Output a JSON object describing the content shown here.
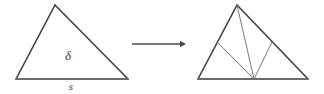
{
  "figure": {
    "background_color": "#ffffff",
    "stroke_color_outer": "#3f3f3f",
    "stroke_color_inner": "#7b7b7b",
    "stroke_color_base": "#6b6b6b",
    "arrow_color": "#4a4a4a",
    "stroke_width_outer": 1.6,
    "stroke_width_inner": 1.0
  },
  "left_triangle": {
    "name": "source-triangle",
    "vertices": {
      "apex": {
        "x": 55,
        "y": 5
      },
      "bottom_left": {
        "x": 16,
        "y": 79
      },
      "bottom_right": {
        "x": 128,
        "y": 79
      }
    },
    "labels": {
      "interior": {
        "text": "δ",
        "x": 68,
        "y": 60
      },
      "base": {
        "text": "s",
        "x": 71,
        "y": 90
      }
    }
  },
  "arrow": {
    "name": "transformation-arrow",
    "x1": 132,
    "y1": 44,
    "x2": 186,
    "y2": 44,
    "head_size": 6
  },
  "right_triangle": {
    "name": "subdivided-triangle",
    "vertices": {
      "apex": {
        "x": 237,
        "y": 5
      },
      "bottom_left": {
        "x": 198,
        "y": 79
      },
      "bottom_right": {
        "x": 308,
        "y": 79
      }
    },
    "base_point": {
      "x": 254,
      "y": 79,
      "name": "base-interior-vertex"
    },
    "left_side_point": {
      "x": 217,
      "y": 42,
      "name": "left-edge-midpoint"
    },
    "right_side_point": {
      "x": 272,
      "y": 42,
      "name": "right-edge-midpoint"
    },
    "internal_segments": [
      {
        "name": "apex-to-base-point",
        "x1": 237,
        "y1": 5,
        "x2": 254,
        "y2": 79
      },
      {
        "name": "left-midpoint-to-base-point",
        "x1": 217,
        "y1": 42,
        "x2": 254,
        "y2": 79
      },
      {
        "name": "right-midpoint-to-base-point",
        "x1": 272,
        "y1": 42,
        "x2": 254,
        "y2": 79
      }
    ]
  }
}
